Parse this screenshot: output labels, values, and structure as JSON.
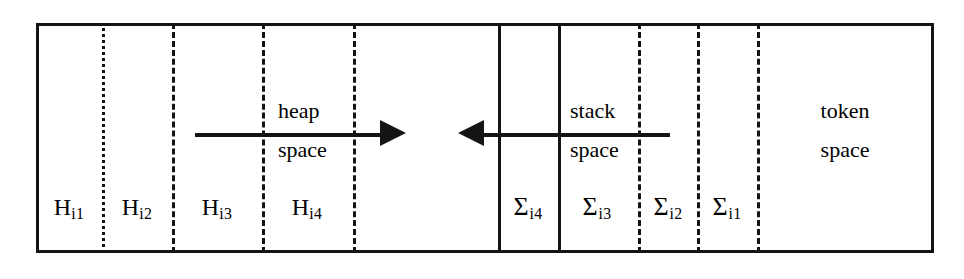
{
  "diagram": {
    "background_color": "#ffffff",
    "ink_color": "#141414",
    "box": {
      "left": 36,
      "top": 23,
      "width": 898,
      "height": 230
    },
    "regions": [
      {
        "name": "H_i1",
        "label_base": "H",
        "label_sub": "i1",
        "center_x": 69,
        "divider_right_x": 102,
        "divider_right_style": "dotted"
      },
      {
        "name": "H_i2",
        "label_base": "H",
        "label_sub": "i2",
        "center_x": 137,
        "divider_right_x": 172,
        "divider_right_style": "dashed"
      },
      {
        "name": "H_i3",
        "label_base": "H",
        "label_sub": "i3",
        "center_x": 217,
        "divider_right_x": 262,
        "divider_right_style": "dashed"
      },
      {
        "name": "H_i4",
        "label_base": "H",
        "label_sub": "i4",
        "center_x": 307,
        "divider_right_x": 353,
        "divider_right_style": "dashed"
      },
      {
        "name": "free_gap",
        "label_base": "",
        "label_sub": "",
        "center_x": 425,
        "divider_right_x": 498,
        "divider_right_style": "solid"
      },
      {
        "name": "Sigma_i4",
        "label_base": "Σ",
        "label_sub": "i4",
        "center_x": 528,
        "divider_right_x": 558,
        "divider_right_style": "solid"
      },
      {
        "name": "Sigma_i3",
        "label_base": "Σ",
        "label_sub": "i3",
        "center_x": 597,
        "divider_right_x": 638,
        "divider_right_style": "dashed"
      },
      {
        "name": "Sigma_i2",
        "label_base": "Σ",
        "label_sub": "i2",
        "center_x": 668,
        "divider_right_x": 697,
        "divider_right_style": "dashed"
      },
      {
        "name": "Sigma_i1",
        "label_base": "Σ",
        "label_sub": "i1",
        "center_x": 727,
        "divider_right_x": 757,
        "divider_right_style": "dashed"
      },
      {
        "name": "token_region",
        "label_base": "",
        "label_sub": "",
        "center_x": 845,
        "divider_right_x": null,
        "divider_right_style": null
      }
    ],
    "labels": {
      "h_i1_base": "H",
      "h_i1_sub": "i1",
      "h_i2_base": "H",
      "h_i2_sub": "i2",
      "h_i3_base": "H",
      "h_i3_sub": "i3",
      "h_i4_base": "H",
      "h_i4_sub": "i4",
      "sigma_i4_base": "Σ",
      "sigma_i4_sub": "i4",
      "sigma_i3_base": "Σ",
      "sigma_i3_sub": "i3",
      "sigma_i2_base": "Σ",
      "sigma_i2_sub": "i2",
      "sigma_i1_base": "Σ",
      "sigma_i1_sub": "i1"
    },
    "annotations": {
      "heap_line1": "heap",
      "heap_line2": "space",
      "stack_line1": "stack",
      "stack_line2": "space",
      "token_line1": "token",
      "token_line2": "space"
    },
    "arrows": [
      {
        "name": "heap-growth-arrow",
        "direction": "right",
        "meaning": "heap space grows to the right",
        "shaft_x1": 195,
        "shaft_x2": 380,
        "tip_x": 406,
        "y": 133
      },
      {
        "name": "stack-growth-arrow",
        "direction": "left",
        "meaning": "stack space grows to the left",
        "shaft_x1": 484,
        "shaft_x2": 670,
        "tip_x": 458,
        "y": 133
      }
    ]
  }
}
